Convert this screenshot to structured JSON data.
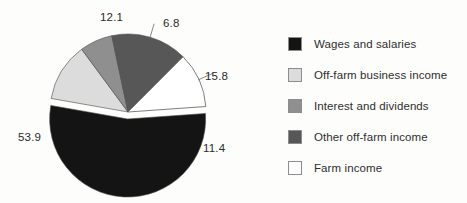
{
  "chart_data": {
    "type": "pie",
    "title": "",
    "subtitle": "",
    "xlabel": "",
    "ylabel": "",
    "grid": false,
    "legend_position": "right",
    "units": "percent",
    "total": 100.0,
    "categories": [
      "Wages and salaries",
      "Off-farm business income",
      "Interest and dividends",
      "Other off-farm income",
      "Farm income"
    ],
    "values": [
      53.9,
      12.1,
      6.8,
      15.8,
      11.4
    ],
    "colors": [
      "#141414",
      "#dcdcdc",
      "#8f8f8f",
      "#575757",
      "#ffffff"
    ],
    "slices": [
      {
        "label": "Wages and salaries",
        "value": 53.9,
        "value_text": "53.9",
        "color": "#141414",
        "exploded": true
      },
      {
        "label": "Off-farm business income",
        "value": 12.1,
        "value_text": "12.1",
        "color": "#dcdcdc",
        "exploded": false
      },
      {
        "label": "Interest and dividends",
        "value": 6.8,
        "value_text": "6.8",
        "color": "#8f8f8f",
        "exploded": false
      },
      {
        "label": "Other off-farm income",
        "value": 15.8,
        "value_text": "15.8",
        "color": "#575757",
        "exploded": false
      },
      {
        "label": "Farm income",
        "value": 11.4,
        "value_text": "11.4",
        "color": "#ffffff",
        "exploded": false
      }
    ]
  },
  "legend": {
    "items": [
      {
        "label": "Wages and salaries",
        "color": "#141414"
      },
      {
        "label": "Off-farm business income",
        "color": "#dcdcdc"
      },
      {
        "label": "Interest and dividends",
        "color": "#8f8f8f"
      },
      {
        "label": "Other off-farm income",
        "color": "#575757"
      },
      {
        "label": "Farm income",
        "color": "#ffffff"
      }
    ]
  }
}
